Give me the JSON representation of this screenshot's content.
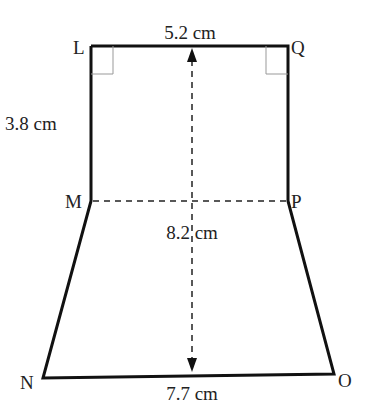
{
  "diagram": {
    "type": "composite shape: rectangle LQPM on top of trapezium MPON",
    "vertices": {
      "L": "L",
      "Q": "Q",
      "M": "M",
      "P": "P",
      "N": "N",
      "O": "O"
    },
    "measurements": {
      "top_LQ": "5.2 cm",
      "side_LM": "3.8 cm",
      "height_total": "8.2 cm",
      "bottom_NO": "7.7 cm"
    },
    "right_angles": [
      "L",
      "Q"
    ],
    "colors": {
      "line": "#111111",
      "right_angle_mark": "#999999",
      "text": "#222222"
    }
  }
}
